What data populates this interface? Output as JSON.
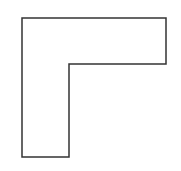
{
  "diagram": {
    "shape": "L-shape",
    "stroke_color": "#333333",
    "fill_color": "#ffffff",
    "background_color": "#ffffff",
    "stroke_width": 1.5,
    "vertices": [
      [
        22,
        18
      ],
      [
        166,
        18
      ],
      [
        166,
        64
      ],
      [
        69,
        64
      ],
      [
        69,
        157
      ],
      [
        22,
        157
      ]
    ]
  }
}
